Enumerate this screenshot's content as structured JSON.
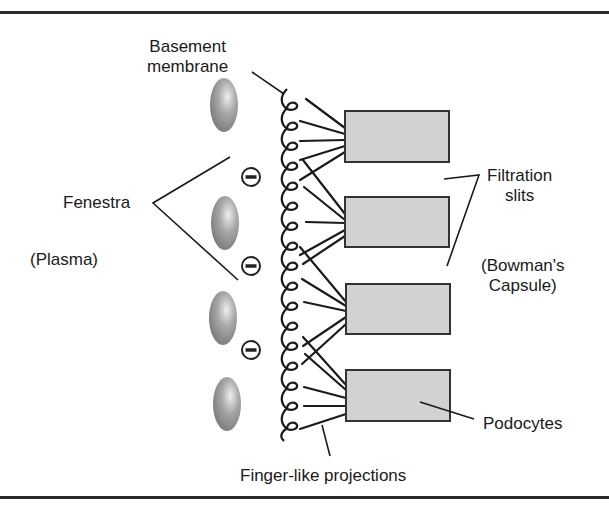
{
  "labels": {
    "basement_membrane_line1": "Basement",
    "basement_membrane_line2": "membrane",
    "fenestra": "Fenestra",
    "plasma": "(Plasma)",
    "filtration_slits_line1": "Filtration",
    "filtration_slits_line2": "slits",
    "bowmans_capsule_line1": "(Bowman's",
    "bowmans_capsule_line2": "Capsule)",
    "podocytes": "Podocytes",
    "finger_like_projections": "Finger-like projections"
  },
  "symbols": {
    "negative_charge": "minus-in-circle"
  },
  "colors": {
    "background": "#ffffff",
    "line": "#222222",
    "podocyte_fill": "#d2d2d2",
    "cell_fill_light": "#d8d8d8",
    "cell_fill_dark": "#8a8a8a"
  },
  "elements": {
    "endothelial_cells": 4,
    "negative_charges": 3,
    "podocytes": 4,
    "membrane_coils": 17
  }
}
